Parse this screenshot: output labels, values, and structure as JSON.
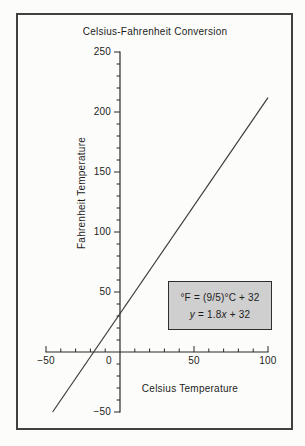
{
  "colors": {
    "paper": "#fcfcfa",
    "frame": "#414141",
    "ink": "#1c1c1c",
    "axis": "#2b2b2b",
    "line": "#3d3d3d",
    "eqbg": "#cfcfcf",
    "eqborder": "#2e2e2e"
  },
  "chart_data": {
    "type": "line",
    "title": "Celsius-Fahrenheit Conversion",
    "xlabel": "Celsius Temperature",
    "ylabel": "Fahrenheit Temperature",
    "xlim": [
      -50,
      100
    ],
    "ylim": [
      -50,
      250
    ],
    "grid": false,
    "minor_tick_step": 10,
    "major_tick_step": 50,
    "x_ticks": [
      {
        "value": -50,
        "label": "−50"
      },
      {
        "value": 0,
        "label": "0"
      },
      {
        "value": 50,
        "label": "50"
      },
      {
        "value": 100,
        "label": "100"
      }
    ],
    "y_ticks": [
      {
        "value": -50,
        "label": "−50"
      },
      {
        "value": 50,
        "label": "50"
      },
      {
        "value": 100,
        "label": "100"
      },
      {
        "value": 150,
        "label": "150"
      },
      {
        "value": 200,
        "label": "200"
      },
      {
        "value": 250,
        "label": "250"
      }
    ],
    "series": [
      {
        "name": "F = 1.8C + 32",
        "points": [
          [
            -45.56,
            -50
          ],
          [
            100,
            212
          ]
        ]
      }
    ]
  },
  "annotation": {
    "line1": "°F = (9/5)°C + 32",
    "line2_parts": {
      "y": "y",
      "eq": " = 1.8",
      "x": "x",
      "tail": " + 32"
    }
  }
}
